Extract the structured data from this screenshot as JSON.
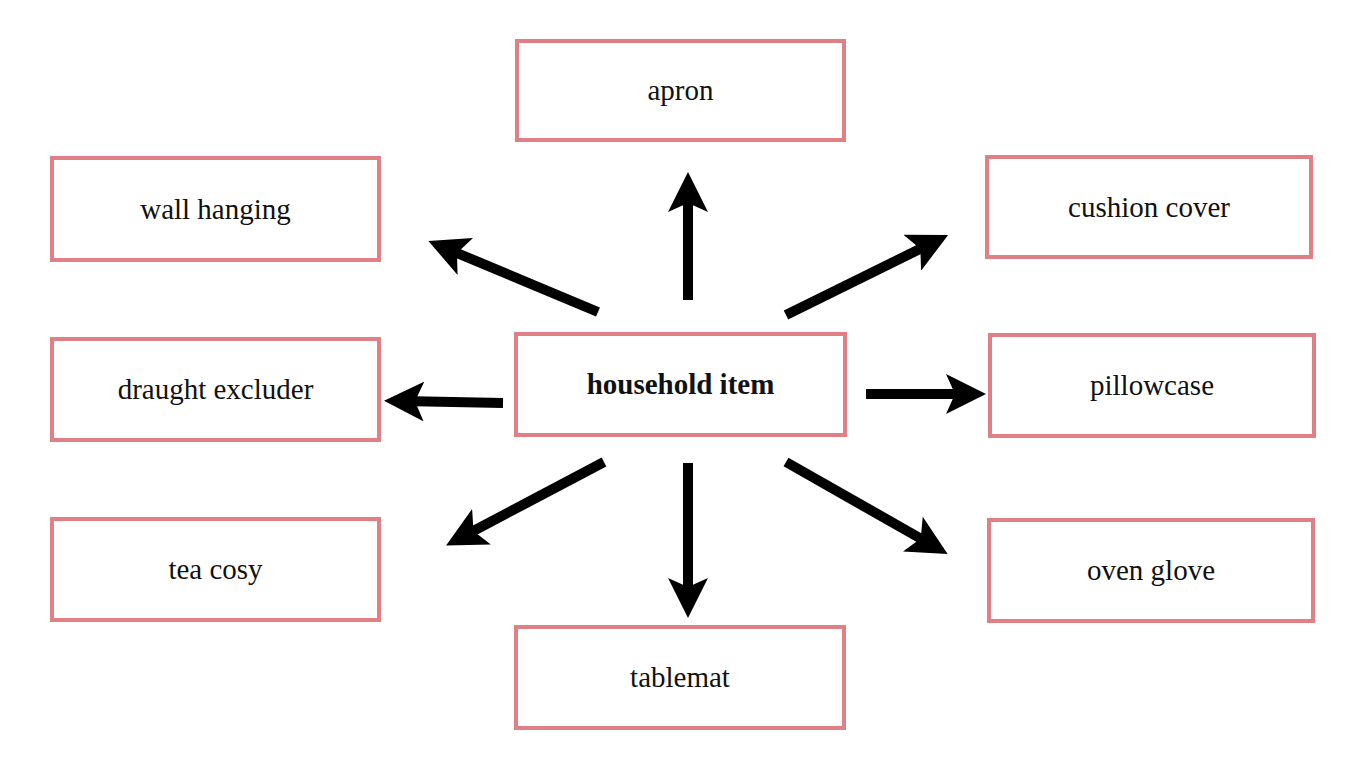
{
  "diagram": {
    "type": "spider",
    "colors": {
      "box_border": "#e07f86",
      "arrow": "#000000",
      "text": "#111111"
    },
    "center": {
      "label": "household item"
    },
    "nodes": [
      {
        "id": "apron",
        "label": "apron"
      },
      {
        "id": "wall-hanging",
        "label": "wall hanging"
      },
      {
        "id": "cushion-cover",
        "label": "cushion cover"
      },
      {
        "id": "draught-excluder",
        "label": "draught excluder"
      },
      {
        "id": "pillowcase",
        "label": "pillowcase"
      },
      {
        "id": "tea-cosy",
        "label": "tea cosy"
      },
      {
        "id": "oven-glove",
        "label": "oven glove"
      },
      {
        "id": "tablemat",
        "label": "tablemat"
      }
    ],
    "edges": [
      {
        "from": "household item",
        "to": "apron"
      },
      {
        "from": "household item",
        "to": "wall hanging"
      },
      {
        "from": "household item",
        "to": "cushion cover"
      },
      {
        "from": "household item",
        "to": "draught excluder"
      },
      {
        "from": "household item",
        "to": "pillowcase"
      },
      {
        "from": "household item",
        "to": "tea cosy"
      },
      {
        "from": "household item",
        "to": "oven glove"
      },
      {
        "from": "household item",
        "to": "tablemat"
      }
    ]
  }
}
